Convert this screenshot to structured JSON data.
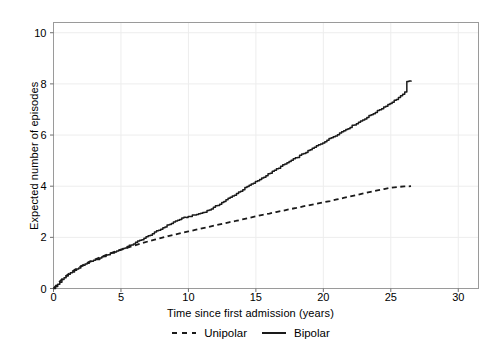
{
  "chart_data": {
    "type": "line",
    "title": "",
    "xlabel": "Time since first admission (years)",
    "ylabel": "Expected number of episodes",
    "xlim": [
      0,
      31.5
    ],
    "ylim": [
      0,
      10.4
    ],
    "xticks": [
      0,
      5,
      10,
      15,
      20,
      25,
      30
    ],
    "yticks": [
      0,
      2,
      4,
      6,
      8,
      10
    ],
    "grid": true,
    "legend_position": "bottom-center",
    "series": [
      {
        "name": "Unipolar",
        "style": "dashed",
        "color": "#1a1a1a",
        "x": [
          0,
          0.2,
          0.4,
          0.6,
          0.9,
          1.2,
          1.6,
          2.0,
          2.5,
          3.0,
          3.5,
          4.0,
          4.5,
          5.0,
          5.5,
          6.0,
          6.5,
          7.0,
          7.5,
          8.0,
          8.5,
          9.0,
          9.5,
          10.0,
          10.5,
          11.0,
          11.5,
          12.0,
          12.5,
          13.0,
          13.5,
          14.0,
          14.5,
          15.0,
          15.5,
          16.0,
          16.5,
          17.0,
          17.5,
          18.0,
          18.5,
          19.0,
          19.5,
          20.0,
          20.5,
          21.0,
          21.5,
          22.0,
          22.5,
          23.0,
          23.5,
          24.0,
          24.5,
          25.0,
          25.5,
          26.0,
          26.5
        ],
        "y": [
          0,
          0.12,
          0.24,
          0.35,
          0.48,
          0.6,
          0.74,
          0.86,
          1.0,
          1.12,
          1.23,
          1.33,
          1.43,
          1.52,
          1.6,
          1.68,
          1.76,
          1.84,
          1.91,
          1.98,
          2.05,
          2.11,
          2.17,
          2.23,
          2.29,
          2.35,
          2.41,
          2.47,
          2.53,
          2.59,
          2.64,
          2.7,
          2.76,
          2.82,
          2.88,
          2.93,
          2.99,
          3.04,
          3.1,
          3.15,
          3.21,
          3.26,
          3.31,
          3.37,
          3.42,
          3.48,
          3.54,
          3.6,
          3.66,
          3.72,
          3.78,
          3.84,
          3.89,
          3.94,
          3.97,
          3.99,
          4.0
        ]
      },
      {
        "name": "Bipolar",
        "style": "solid",
        "color": "#1a1a1a",
        "x": [
          0,
          0.2,
          0.4,
          0.6,
          0.8,
          1.0,
          1.3,
          1.6,
          1.9,
          2.2,
          2.5,
          2.8,
          3.1,
          3.4,
          3.7,
          4.0,
          4.3,
          4.6,
          5.0,
          5.4,
          5.8,
          6.2,
          6.6,
          7.0,
          7.4,
          7.8,
          8.2,
          8.6,
          9.0,
          9.3,
          9.6,
          9.9,
          10.2,
          10.5,
          10.9,
          11.3,
          11.7,
          12.1,
          12.5,
          12.9,
          13.3,
          13.7,
          14.1,
          14.5,
          15.0,
          15.5,
          16.0,
          16.5,
          17.0,
          17.5,
          18.0,
          18.5,
          19.0,
          19.5,
          20.0,
          20.5,
          21.0,
          21.5,
          22.0,
          22.5,
          23.0,
          23.5,
          24.0,
          24.5,
          25.0,
          25.4,
          25.8,
          26.0,
          26.2,
          26.5
        ],
        "y": [
          0,
          0.1,
          0.22,
          0.33,
          0.42,
          0.52,
          0.63,
          0.72,
          0.82,
          0.92,
          1.0,
          1.06,
          1.12,
          1.18,
          1.25,
          1.32,
          1.39,
          1.45,
          1.53,
          1.62,
          1.72,
          1.83,
          1.94,
          2.05,
          2.17,
          2.28,
          2.4,
          2.52,
          2.62,
          2.7,
          2.76,
          2.8,
          2.84,
          2.88,
          2.94,
          3.02,
          3.12,
          3.24,
          3.37,
          3.5,
          3.63,
          3.76,
          3.9,
          4.03,
          4.18,
          4.34,
          4.5,
          4.66,
          4.82,
          4.97,
          5.12,
          5.27,
          5.42,
          5.57,
          5.72,
          5.87,
          6.02,
          6.17,
          6.32,
          6.47,
          6.62,
          6.78,
          6.94,
          7.1,
          7.26,
          7.4,
          7.55,
          7.62,
          8.1,
          8.1
        ]
      }
    ]
  },
  "legend": {
    "items": [
      {
        "label": "Unipolar",
        "style": "dashed"
      },
      {
        "label": "Bipolar",
        "style": "solid"
      }
    ]
  }
}
